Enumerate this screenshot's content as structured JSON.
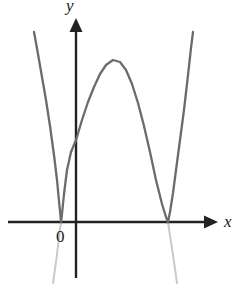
{
  "figure": {
    "name": "quartic-curve-graph",
    "background_color": "#ffffff"
  },
  "labels": {
    "y_axis": "y",
    "x_axis": "x",
    "origin": "0"
  },
  "colors": {
    "axis": "#222222",
    "curve": "#6b6b6b",
    "curve_faint": "#c9c9c9",
    "text": "#1a1a1a"
  },
  "chart_data": {
    "type": "line",
    "title": "",
    "xlabel": "x",
    "ylabel": "y",
    "grid": false,
    "legend": null,
    "annotations": [
      "0"
    ],
    "axes": {
      "x_axis_pixel_y": 222,
      "y_axis_pixel_x": 76,
      "x_axis_from_pixel_x": 8,
      "x_axis_to_pixel_x": 212,
      "y_axis_from_pixel_y": 278,
      "y_axis_to_pixel_y": 22,
      "x_arrow": true,
      "y_arrow": true
    },
    "features": {
      "shape": "w-shaped quartic",
      "roots_pixel_x": [
        61,
        168
      ],
      "root_count": 2,
      "root_type": "tangent (double roots)",
      "local_max_pixel": [
        113,
        60
      ],
      "y_intercept_pixel_y": 140,
      "left_branch_start_pixel": [
        34,
        32
      ],
      "right_branch_end_pixel": [
        193,
        32
      ]
    },
    "series": [
      {
        "name": "quartic-curve",
        "color": "#6b6b6b",
        "points_pixel": [
          [
            34,
            32
          ],
          [
            38,
            54
          ],
          [
            42,
            77
          ],
          [
            46,
            100
          ],
          [
            50,
            126
          ],
          [
            54,
            155
          ],
          [
            57,
            180
          ],
          [
            59,
            201
          ],
          [
            60.5,
            216
          ],
          [
            61,
            222
          ],
          [
            62,
            214
          ],
          [
            64,
            194
          ],
          [
            67,
            170
          ],
          [
            71,
            152
          ],
          [
            76,
            140
          ],
          [
            82,
            120
          ],
          [
            88,
            102
          ],
          [
            94,
            87
          ],
          [
            100,
            74
          ],
          [
            106,
            65
          ],
          [
            113,
            60
          ],
          [
            120,
            62
          ],
          [
            126,
            70
          ],
          [
            132,
            84
          ],
          [
            138,
            103
          ],
          [
            144,
            126
          ],
          [
            150,
            152
          ],
          [
            156,
            180
          ],
          [
            162,
            204
          ],
          [
            166,
            217
          ],
          [
            168,
            222
          ],
          [
            170,
            212
          ],
          [
            173,
            193
          ],
          [
            176,
            170
          ],
          [
            180,
            140
          ],
          [
            184,
            110
          ],
          [
            188,
            75
          ],
          [
            191,
            48
          ],
          [
            193,
            32
          ]
        ]
      },
      {
        "name": "faint-extension-left",
        "color": "#c9c9c9",
        "points_pixel": [
          [
            61,
            222
          ],
          [
            56,
            262
          ],
          [
            53,
            283
          ]
        ]
      },
      {
        "name": "faint-extension-right",
        "color": "#c9c9c9",
        "points_pixel": [
          [
            168,
            222
          ],
          [
            174,
            262
          ],
          [
            177,
            283
          ]
        ]
      }
    ]
  }
}
